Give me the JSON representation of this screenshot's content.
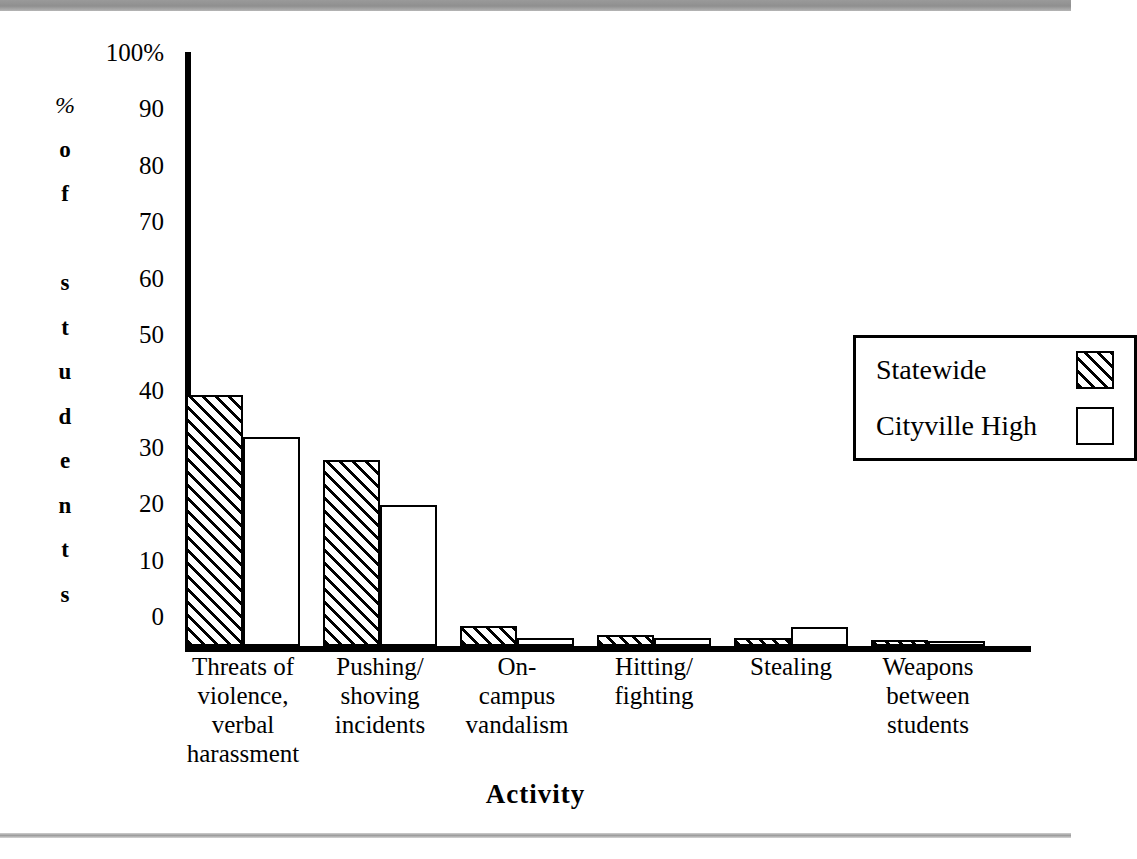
{
  "chart_data": {
    "type": "bar",
    "title": "",
    "xlabel": "Activity",
    "ylabel": "% of students",
    "ylabel_chars": [
      "%",
      "o",
      "f",
      "",
      "s",
      "t",
      "u",
      "d",
      "e",
      "n",
      "t",
      "s"
    ],
    "ylim": [
      0,
      100
    ],
    "ytick_labels": [
      "100%",
      "90",
      "80",
      "70",
      "60",
      "50",
      "40",
      "30",
      "20",
      "10",
      "0"
    ],
    "ytick_values": [
      100,
      90,
      80,
      70,
      60,
      50,
      40,
      30,
      20,
      10,
      0
    ],
    "grid": false,
    "legend_position": "upper right",
    "categories": [
      "Threats of\nviolence,\nverbal\nharassment",
      "Pushing/\nshoving\nincidents",
      "On-\ncampus\nvandalism",
      "Hitting/\nfighting",
      "Stealing",
      "Weapons\nbetween\nstudents"
    ],
    "series": [
      {
        "name": "Statewide",
        "fill": "hatched",
        "color": "#000000",
        "values": [
          44.5,
          33,
          3.5,
          2,
          1.5,
          1
        ]
      },
      {
        "name": "Cityville High",
        "fill": "white",
        "color": "#ffffff",
        "values": [
          37,
          25,
          1.5,
          1.5,
          3.3,
          0.5
        ]
      }
    ]
  },
  "legend": {
    "entries": [
      {
        "label": "Statewide"
      },
      {
        "label": "Cityville High"
      }
    ]
  },
  "colors": {
    "ink": "#000000",
    "paper": "#ffffff",
    "scan_band": "#8f8f8f"
  }
}
